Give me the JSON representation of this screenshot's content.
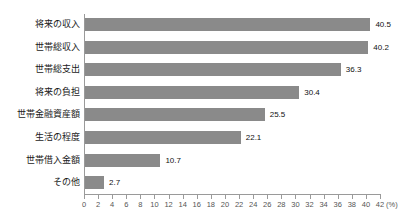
{
  "chart_data": {
    "type": "bar",
    "orientation": "horizontal",
    "title": "",
    "xlabel": "(%)",
    "ylabel": "",
    "xlim": [
      0,
      42
    ],
    "xticks": [
      0,
      2,
      4,
      6,
      8,
      10,
      12,
      14,
      16,
      18,
      20,
      22,
      24,
      26,
      28,
      30,
      32,
      34,
      36,
      38,
      40,
      42
    ],
    "unit": "(%)",
    "grid": false,
    "legend": false,
    "categories": [
      "将来の収入",
      "世帯総収入",
      "世帯総支出",
      "将来の負担",
      "世帯金融資産額",
      "生活の程度",
      "世帯借入金額",
      "その他"
    ],
    "values": [
      40.5,
      40.2,
      36.3,
      30.4,
      25.5,
      22.1,
      10.7,
      2.7
    ],
    "value_labels": [
      "40.5",
      "40.2",
      "36.3",
      "30.4",
      "25.5",
      "22.1",
      "10.7",
      "2.7"
    ],
    "bar_color": "#8a8a8a",
    "axis_color": "#9a9a9a",
    "background": "#ffffff"
  }
}
